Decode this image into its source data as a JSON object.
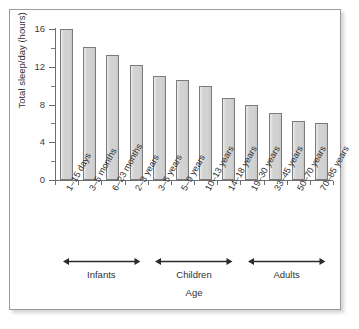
{
  "chart_data": {
    "type": "bar",
    "title": "",
    "xlabel": "Age",
    "ylabel": "Total sleep/day (hours)",
    "ylim": [
      0,
      16
    ],
    "ytick_major": [
      0,
      4,
      8,
      12,
      16
    ],
    "ytick_minor": [
      2,
      6,
      10,
      14
    ],
    "grid": false,
    "legend": "none",
    "categories": [
      "1–15 days",
      "3–5 months",
      "6–23 months",
      "2–3 years",
      "3–5 years",
      "5–9 years",
      "10–13 years",
      "14–18 years",
      "19–30 years",
      "33–45 years",
      "50–70 years",
      "70–85 years"
    ],
    "values": [
      16.0,
      14.1,
      13.2,
      12.2,
      11.0,
      10.6,
      10.0,
      8.7,
      7.9,
      7.1,
      6.2,
      6.0
    ],
    "groups": [
      {
        "label": "Infants",
        "from": 0,
        "to": 3
      },
      {
        "label": "Children",
        "from": 4,
        "to": 7
      },
      {
        "label": "Adults",
        "from": 8,
        "to": 11
      }
    ],
    "bar_fill": "#d2d2d2",
    "bar_stroke": "#7b7b7b",
    "axis_color": "#6e6e6e"
  },
  "axis": {
    "y_title": "Total sleep/day (hours)",
    "x_title": "Age",
    "y_labels": [
      "16",
      "12",
      "8",
      "4",
      "0"
    ]
  },
  "groups": {
    "infants": "Infants",
    "children": "Children",
    "adults": "Adults"
  }
}
